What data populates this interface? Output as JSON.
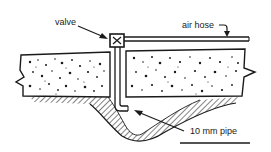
{
  "diagram": {
    "labels": {
      "valve": "valve",
      "air_hose": "air hose",
      "pipe": "10 mm pipe"
    },
    "components": [
      {
        "id": "valve",
        "label": "valve"
      },
      {
        "id": "air-hose",
        "label": "air hose"
      },
      {
        "id": "pipe",
        "label": "10 mm pipe"
      },
      {
        "id": "concrete-slab-left"
      },
      {
        "id": "concrete-slab-right"
      },
      {
        "id": "ground-cavity"
      }
    ],
    "colors": {
      "ink": "#1a1a1a",
      "background": "#ffffff"
    }
  }
}
